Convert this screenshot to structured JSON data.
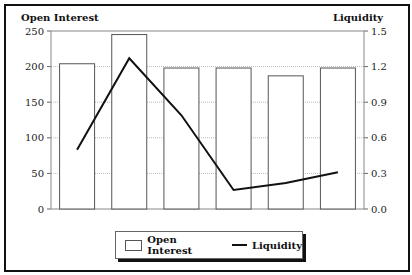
{
  "chart_data": {
    "type": "bar+line",
    "categories": [
      "1",
      "2",
      "3",
      "4",
      "5",
      "6"
    ],
    "series": [
      {
        "name": "Open Interest",
        "type": "bar",
        "axis": "left",
        "values": [
          204,
          245,
          198,
          198,
          187,
          198
        ]
      },
      {
        "name": "Liquidity",
        "type": "line",
        "axis": "right",
        "values": [
          0.5,
          1.27,
          0.79,
          0.16,
          0.22,
          0.31
        ]
      }
    ],
    "left_axis": {
      "label": "Open Interest",
      "ticks": [
        "0",
        "50",
        "100",
        "150",
        "200",
        "250"
      ],
      "range": [
        0,
        250
      ]
    },
    "right_axis": {
      "label": "Liquidity",
      "ticks": [
        "0.0",
        "0.3",
        "0.6",
        "0.9",
        "1.2",
        "1.5"
      ],
      "range": [
        0,
        1.5
      ]
    },
    "grid": true,
    "legend_position": "bottom"
  },
  "legend": {
    "items": [
      {
        "label": "Open Interest",
        "kind": "bar"
      },
      {
        "label": "Liquidity",
        "kind": "line"
      }
    ]
  },
  "colors": {
    "bar_fill": "#ffffff",
    "bar_stroke": "#555555",
    "line": "#111111",
    "grid": "#bbbbbb"
  }
}
